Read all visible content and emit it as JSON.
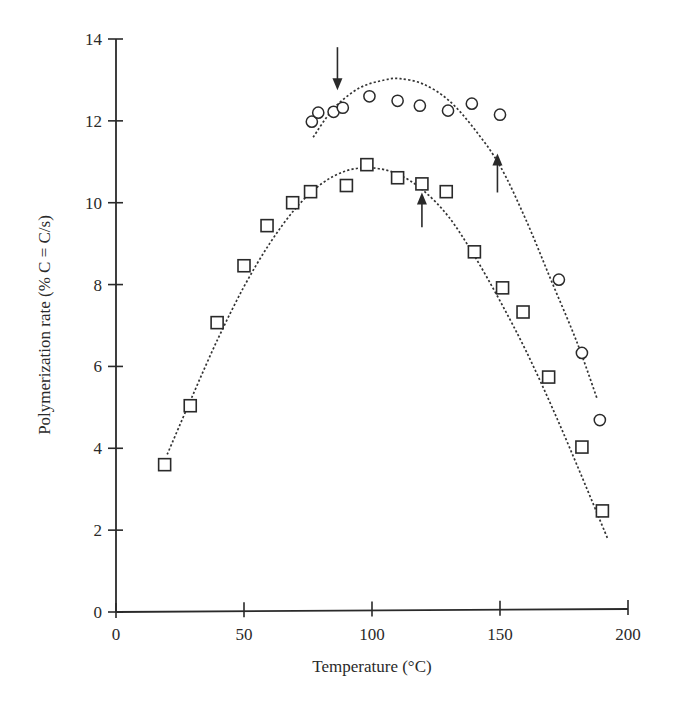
{
  "chart_data": {
    "type": "scatter",
    "title": "",
    "xlabel": "Temperature (°C)",
    "ylabel": "Polymerization rate (% C = C/s)",
    "xlim": [
      0,
      200
    ],
    "ylim": [
      0,
      14
    ],
    "xticks": [
      0,
      50,
      100,
      150,
      200
    ],
    "yticks": [
      0,
      2,
      4,
      6,
      8,
      10,
      12,
      14
    ],
    "grid": false,
    "legend": null,
    "series": [
      {
        "name": "circles",
        "marker": "circle",
        "points": [
          [
            76.5,
            11.98
          ],
          [
            79,
            12.2
          ],
          [
            85,
            12.22
          ],
          [
            88.6,
            12.32
          ],
          [
            99,
            12.6
          ],
          [
            110,
            12.49
          ],
          [
            118.7,
            12.37
          ],
          [
            129.7,
            12.25
          ],
          [
            139,
            12.42
          ],
          [
            150,
            12.15
          ],
          [
            173,
            8.12
          ],
          [
            182,
            6.33
          ],
          [
            189,
            4.69
          ]
        ],
        "fit_curve": [
          [
            77,
            11.6
          ],
          [
            85,
            12.3
          ],
          [
            95,
            12.8
          ],
          [
            105,
            13.0
          ],
          [
            111,
            13.03
          ],
          [
            120,
            12.9
          ],
          [
            130,
            12.5
          ],
          [
            140,
            11.8
          ],
          [
            150,
            10.9
          ],
          [
            160,
            9.6
          ],
          [
            170,
            8.1
          ],
          [
            180,
            6.6
          ],
          [
            188,
            5.2
          ]
        ]
      },
      {
        "name": "squares",
        "marker": "square",
        "points": [
          [
            19,
            3.6
          ],
          [
            29,
            5.04
          ],
          [
            39.5,
            7.07
          ],
          [
            50,
            8.46
          ],
          [
            59,
            9.44
          ],
          [
            69,
            10.0
          ],
          [
            76,
            10.27
          ],
          [
            90,
            10.42
          ],
          [
            98,
            10.93
          ],
          [
            110,
            10.61
          ],
          [
            119.5,
            10.46
          ],
          [
            129,
            10.27
          ],
          [
            140,
            8.8
          ],
          [
            151,
            7.92
          ],
          [
            159,
            7.33
          ],
          [
            169,
            5.74
          ],
          [
            182,
            4.03
          ],
          [
            190,
            2.47
          ]
        ],
        "fit_curve": [
          [
            20,
            3.85
          ],
          [
            30,
            5.3
          ],
          [
            40,
            6.7
          ],
          [
            50,
            7.95
          ],
          [
            60,
            9.0
          ],
          [
            70,
            9.85
          ],
          [
            80,
            10.45
          ],
          [
            90,
            10.78
          ],
          [
            100,
            10.85
          ],
          [
            110,
            10.7
          ],
          [
            120,
            10.3
          ],
          [
            130,
            9.65
          ],
          [
            140,
            8.7
          ],
          [
            150,
            7.6
          ],
          [
            160,
            6.4
          ],
          [
            170,
            5.05
          ],
          [
            180,
            3.6
          ],
          [
            192,
            1.8
          ]
        ]
      }
    ],
    "annotations": [
      {
        "type": "arrow",
        "direction": "down",
        "x": 86.5,
        "y_from": 13.8,
        "y_to": 12.75
      },
      {
        "type": "arrow",
        "direction": "up",
        "x": 119.5,
        "y_from": 9.4,
        "y_to": 10.25
      },
      {
        "type": "arrow",
        "direction": "up",
        "x": 149,
        "y_from": 10.25,
        "y_to": 11.2
      }
    ]
  },
  "axes": {
    "x_title": "Temperature (°C)",
    "y_title": "Polymerization rate (% C = C/s)",
    "x_tick_labels": [
      "0",
      "50",
      "100",
      "150",
      "200"
    ],
    "y_tick_labels": [
      "0",
      "2",
      "4",
      "6",
      "8",
      "10",
      "12",
      "14"
    ]
  }
}
